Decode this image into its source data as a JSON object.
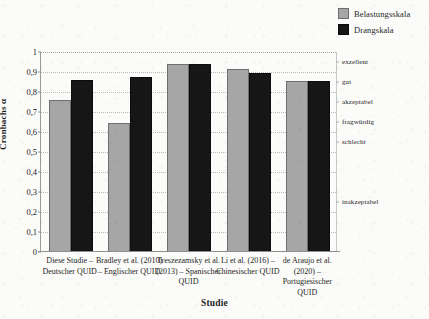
{
  "legend": {
    "position": "top-right",
    "items": [
      {
        "label": "Belastungsskala",
        "color": "#a6a6a6",
        "swatch_name": "legend-swatch-belastungsskala"
      },
      {
        "label": "Drangskala",
        "color": "#161616",
        "swatch_name": "legend-swatch-drangskala"
      }
    ]
  },
  "axes": {
    "y_title": "Cronbachs α",
    "x_title": "Studie",
    "y_ticks": [
      "0",
      "0,1",
      "0,2",
      "0,3",
      "0,4",
      "0,5",
      "0,6",
      "0,7",
      "0,8",
      "0,9",
      "1"
    ],
    "secondary_labels": [
      {
        "text": "exzellent",
        "value": 0.95
      },
      {
        "text": "gut",
        "value": 0.85
      },
      {
        "text": "akzeptabel",
        "value": 0.75
      },
      {
        "text": "fragwürdig",
        "value": 0.65
      },
      {
        "text": "schlecht",
        "value": 0.55
      },
      {
        "text": "inakzeptabel",
        "value": 0.25
      }
    ]
  },
  "chart_data": {
    "type": "bar",
    "title": "",
    "xlabel": "Studie",
    "ylabel": "Cronbachs α",
    "ylim": [
      0,
      1
    ],
    "ytick_step": 0.1,
    "grid": true,
    "legend_position": "top-right",
    "categories": [
      "Diese Studie – Deutscher QUID",
      "Bradley et al. (2010) – Englischer QUID",
      "Treszezamsky et al. (2013) – Spanischer QUID",
      "Li et al. (2016) – Chinesischer QUID",
      "de Araujo et al. (2020) – Portugiesischer QUID"
    ],
    "series": [
      {
        "name": "Belastungsskala",
        "color": "#a6a6a6",
        "values": [
          0.76,
          0.645,
          0.94,
          0.915,
          0.855
        ]
      },
      {
        "name": "Drangskala",
        "color": "#161616",
        "values": [
          0.86,
          0.875,
          0.94,
          0.895,
          0.855
        ]
      }
    ],
    "secondary_axis_labels": [
      "exzellent",
      "gut",
      "akzeptabel",
      "fragwürdig",
      "schlecht",
      "inakzeptabel"
    ]
  }
}
